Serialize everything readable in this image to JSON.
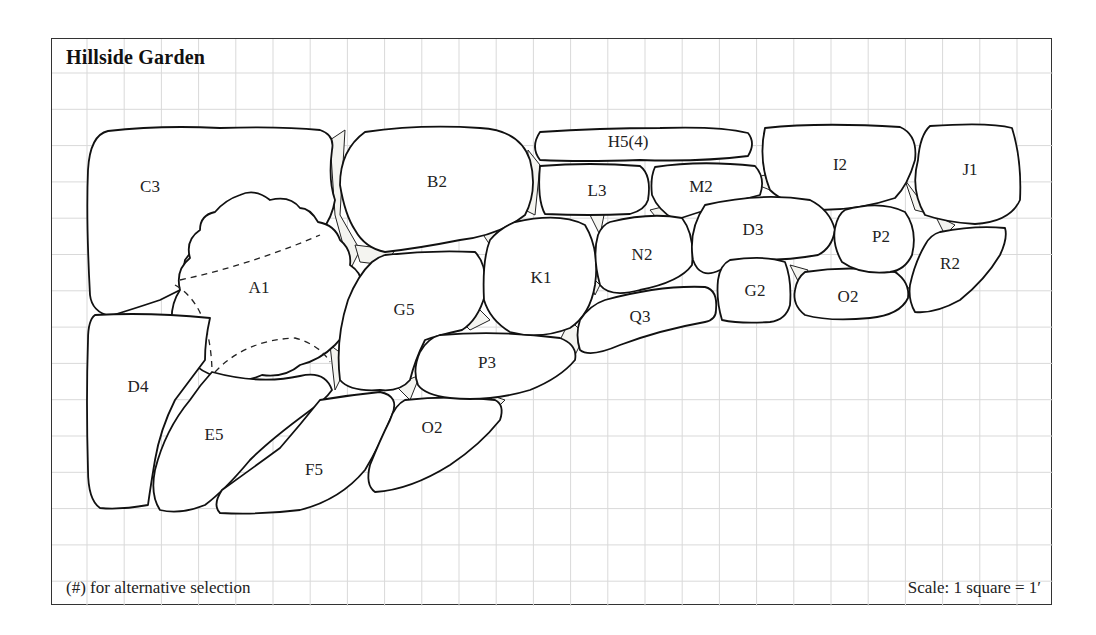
{
  "diagram": {
    "title": "Hillside Garden",
    "note": "(#) for alternative selection",
    "scale": "Scale: 1 square = 1′",
    "grid": {
      "square_feet": 1,
      "color": "#d9d9d9"
    },
    "stones": [
      {
        "id": "C3",
        "label": "C3",
        "x": 150,
        "y": 192
      },
      {
        "id": "B2",
        "label": "B2",
        "x": 437,
        "y": 187
      },
      {
        "id": "H5",
        "label": "H5(4)",
        "x": 628,
        "y": 147
      },
      {
        "id": "L3",
        "label": "L3",
        "x": 597,
        "y": 196
      },
      {
        "id": "M2",
        "label": "M2",
        "x": 701,
        "y": 192
      },
      {
        "id": "I2",
        "label": "I2",
        "x": 840,
        "y": 170
      },
      {
        "id": "J1",
        "label": "J1",
        "x": 970,
        "y": 175
      },
      {
        "id": "A1",
        "label": "A1",
        "x": 259,
        "y": 293
      },
      {
        "id": "D4",
        "label": "D4",
        "x": 138,
        "y": 392
      },
      {
        "id": "E5",
        "label": "E5",
        "x": 214,
        "y": 440
      },
      {
        "id": "F5",
        "label": "F5",
        "x": 314,
        "y": 475
      },
      {
        "id": "O2a",
        "label": "O2",
        "x": 432,
        "y": 433
      },
      {
        "id": "G5",
        "label": "G5",
        "x": 404,
        "y": 315
      },
      {
        "id": "P3",
        "label": "P3",
        "x": 487,
        "y": 368
      },
      {
        "id": "K1",
        "label": "K1",
        "x": 541,
        "y": 283
      },
      {
        "id": "N2",
        "label": "N2",
        "x": 642,
        "y": 260
      },
      {
        "id": "Q3",
        "label": "Q3",
        "x": 640,
        "y": 322
      },
      {
        "id": "D3",
        "label": "D3",
        "x": 753,
        "y": 235
      },
      {
        "id": "G2",
        "label": "G2",
        "x": 755,
        "y": 296
      },
      {
        "id": "O2b",
        "label": "O2",
        "x": 848,
        "y": 302
      },
      {
        "id": "P2",
        "label": "P2",
        "x": 881,
        "y": 242
      },
      {
        "id": "R2",
        "label": "R2",
        "x": 950,
        "y": 269
      }
    ]
  }
}
